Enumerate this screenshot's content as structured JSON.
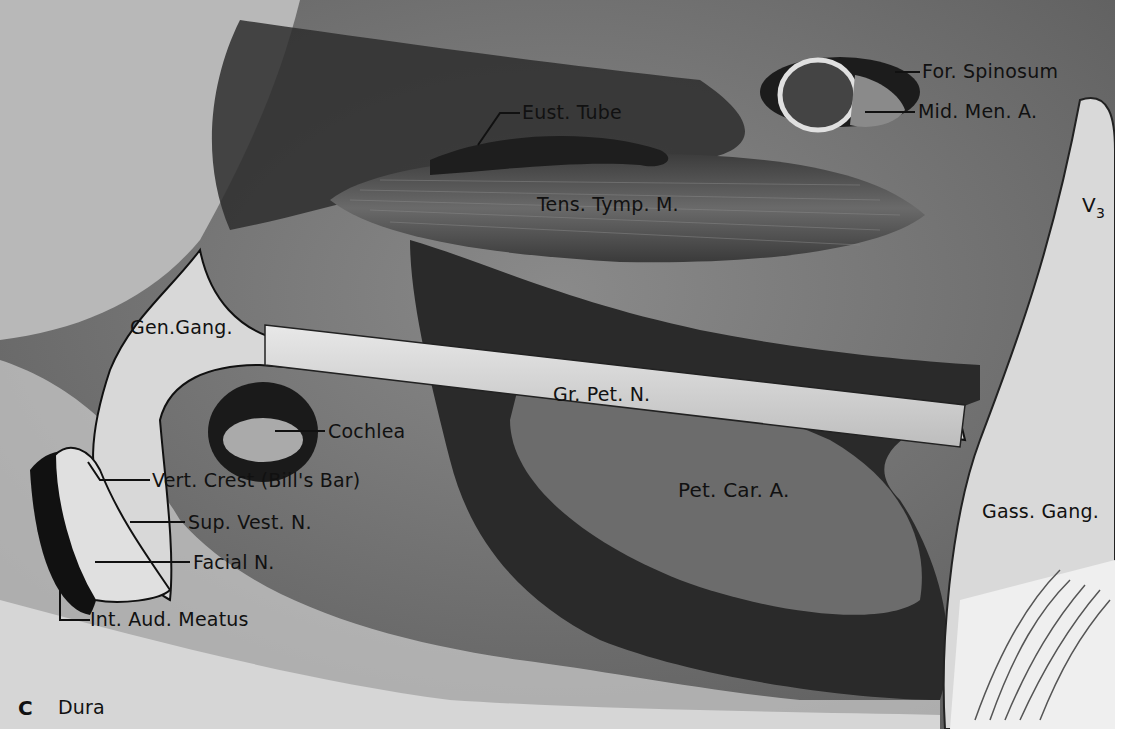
{
  "figure": {
    "panel_letter": "C",
    "panel_caption": "Dura",
    "labels": {
      "for_spinosum": "For. Spinosum",
      "mid_men_a": "Mid. Men. A.",
      "eust_tube": "Eust. Tube",
      "tens_tymp_m": "Tens. Tymp. M.",
      "v3_main": "V",
      "v3_sub": "3",
      "gen_gang": "Gen.Gang.",
      "gr_pet_n": "Gr. Pet. N.",
      "cochlea": "Cochlea",
      "vert_crest": "Vert. Crest (Bill's Bar)",
      "sup_vest_n": "Sup. Vest. N.",
      "facial_n": "Facial N.",
      "int_aud_meatus": "Int. Aud. Meatus",
      "pet_car_a": "Pet. Car. A.",
      "gass_gang": "Gass. Gang."
    }
  }
}
